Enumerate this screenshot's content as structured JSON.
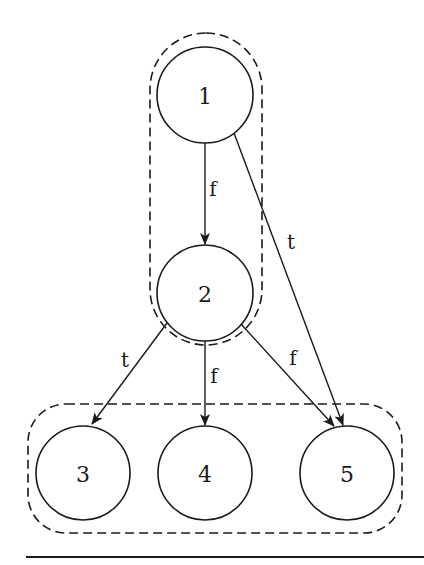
{
  "diagram": {
    "type": "control-flow-graph",
    "nodes": [
      {
        "id": "1",
        "label": "1",
        "cx": 205,
        "cy": 95,
        "r": 48
      },
      {
        "id": "2",
        "label": "2",
        "cx": 205,
        "cy": 293,
        "r": 48
      },
      {
        "id": "3",
        "label": "3",
        "cx": 83,
        "cy": 473,
        "r": 47
      },
      {
        "id": "4",
        "label": "4",
        "cx": 205,
        "cy": 473,
        "r": 47
      },
      {
        "id": "5",
        "label": "5",
        "cx": 347,
        "cy": 473,
        "r": 47
      }
    ],
    "edges": [
      {
        "from": "1",
        "to": "2",
        "label": "f"
      },
      {
        "from": "1",
        "to": "5",
        "label": "t"
      },
      {
        "from": "2",
        "to": "3",
        "label": "t"
      },
      {
        "from": "2",
        "to": "4",
        "label": "f"
      },
      {
        "from": "2",
        "to": "5",
        "label": "f"
      }
    ],
    "groups": [
      {
        "id": "group-top",
        "members": [
          "1",
          "2"
        ]
      },
      {
        "id": "group-bottom",
        "members": [
          "3",
          "4",
          "5"
        ]
      }
    ]
  }
}
